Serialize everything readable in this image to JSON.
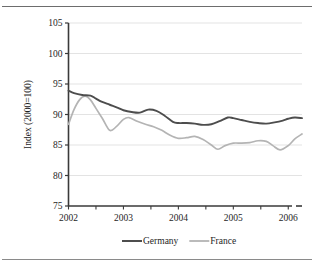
{
  "figure": {
    "background_color": "#ffffff",
    "top_rule_color": "#6d6d6d",
    "bottom_rule_color": "#8a8a8a"
  },
  "chart_data": {
    "type": "line",
    "title": "",
    "subtitle": "",
    "xlabel": "",
    "ylabel": "Index (2000=100)",
    "xlim": [
      2002,
      2006.25
    ],
    "ylim": [
      75,
      105
    ],
    "grid": true,
    "grid_axis": "y",
    "legend_position": "bottom",
    "x_tick_labels": [
      "2002",
      "2003",
      "2004",
      "2005",
      "2006"
    ],
    "x_ticks": [
      2002,
      2003,
      2004,
      2005,
      2006
    ],
    "x_minor_ticks": [
      2002.5,
      2003.5,
      2004.5,
      2005.5
    ],
    "y_tick_labels": [
      "75",
      "80",
      "85",
      "90",
      "95",
      "100",
      "105"
    ],
    "y_ticks": [
      75,
      80,
      85,
      90,
      95,
      100,
      105
    ],
    "series": [
      {
        "name": "Germany",
        "color": "#4d4d4d",
        "line_width": 1.9,
        "x": [
          2002.0,
          2002.1,
          2002.25,
          2002.4,
          2002.5,
          2002.6,
          2002.75,
          2002.9,
          2003.0,
          2003.15,
          2003.3,
          2003.45,
          2003.6,
          2003.75,
          2003.9,
          2004.0,
          2004.15,
          2004.3,
          2004.45,
          2004.6,
          2004.75,
          2004.9,
          2005.0,
          2005.15,
          2005.3,
          2005.45,
          2005.6,
          2005.75,
          2005.9,
          2006.0,
          2006.12,
          2006.25
        ],
        "values": [
          93.9,
          93.5,
          93.2,
          93.1,
          92.6,
          92.1,
          91.6,
          91.1,
          90.7,
          90.4,
          90.3,
          90.8,
          90.6,
          89.8,
          88.8,
          88.6,
          88.6,
          88.5,
          88.3,
          88.4,
          88.9,
          89.5,
          89.4,
          89.1,
          88.8,
          88.6,
          88.5,
          88.7,
          89.0,
          89.3,
          89.5,
          89.4
        ]
      },
      {
        "name": "France",
        "color": "#b4b4b4",
        "line_width": 1.7,
        "x": [
          2002.0,
          2002.1,
          2002.2,
          2002.3,
          2002.4,
          2002.5,
          2002.62,
          2002.75,
          2002.87,
          2003.0,
          2003.1,
          2003.25,
          2003.4,
          2003.55,
          2003.7,
          2003.85,
          2004.0,
          2004.15,
          2004.3,
          2004.45,
          2004.6,
          2004.72,
          2004.85,
          2005.0,
          2005.15,
          2005.3,
          2005.45,
          2005.6,
          2005.72,
          2005.85,
          2006.0,
          2006.12,
          2006.25
        ],
        "values": [
          88.4,
          90.8,
          92.4,
          93.0,
          92.4,
          91.0,
          89.3,
          87.4,
          88.0,
          89.2,
          89.5,
          88.9,
          88.4,
          88.0,
          87.4,
          86.6,
          86.1,
          86.2,
          86.4,
          85.9,
          85.0,
          84.3,
          84.9,
          85.3,
          85.3,
          85.4,
          85.7,
          85.6,
          84.9,
          84.2,
          84.9,
          86.0,
          86.8
        ]
      }
    ]
  },
  "legend": {
    "items": [
      {
        "label": "Germany",
        "color": "#4d4d4d"
      },
      {
        "label": "France",
        "color": "#b4b4b4"
      }
    ]
  }
}
